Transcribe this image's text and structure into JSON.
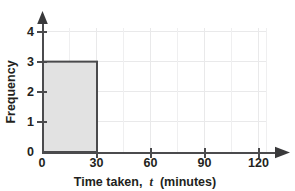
{
  "chart_data": {
    "type": "bar",
    "title": "",
    "subtitle": "",
    "xlabel_prefix": "Time taken,",
    "xlabel_variable": "t",
    "xlabel_suffix": "(minutes)",
    "xlabel": "Time taken, t (minutes)",
    "ylabel": "Frequency",
    "xlim": [
      0,
      120
    ],
    "ylim": [
      0,
      4
    ],
    "x_tick_labels": [
      "0",
      "30",
      "60",
      "90",
      "120"
    ],
    "x_tick_values": [
      0,
      30,
      60,
      90,
      120
    ],
    "y_tick_labels": [
      "0",
      "1",
      "2",
      "3",
      "4"
    ],
    "y_tick_values": [
      0,
      1,
      2,
      3,
      4
    ],
    "x_minor_gridline_step": 15,
    "y_gridline_step": 1,
    "grid": true,
    "legend": "none",
    "bar_color": "#e2e2e2",
    "bar_edge_color": "#4a4a4c",
    "axis_color": "#4b4b4d",
    "gridline_color": "#e9e9ea",
    "bars": [
      {
        "label": "0-30",
        "x_start": 0,
        "x_end": 30,
        "value": 3
      }
    ],
    "categories": [
      "0-30"
    ],
    "values": [
      3
    ]
  }
}
